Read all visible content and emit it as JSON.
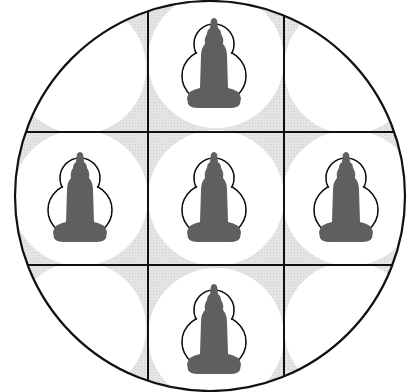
{
  "diagram": {
    "colors": {
      "background": "#ffffff",
      "tone": "#e2e2e2",
      "disc": "#ffffff",
      "line": "#111111",
      "figure": "#5f5f5f"
    },
    "grid": {
      "rows": 3,
      "cols": 3
    },
    "cells": [
      {
        "row": 0,
        "col": 0,
        "figure": false
      },
      {
        "row": 0,
        "col": 1,
        "figure": true
      },
      {
        "row": 0,
        "col": 2,
        "figure": false
      },
      {
        "row": 1,
        "col": 0,
        "figure": true
      },
      {
        "row": 1,
        "col": 1,
        "figure": true
      },
      {
        "row": 1,
        "col": 2,
        "figure": true
      },
      {
        "row": 2,
        "col": 0,
        "figure": false
      },
      {
        "row": 2,
        "col": 1,
        "figure": true
      },
      {
        "row": 2,
        "col": 2,
        "figure": false
      }
    ]
  }
}
